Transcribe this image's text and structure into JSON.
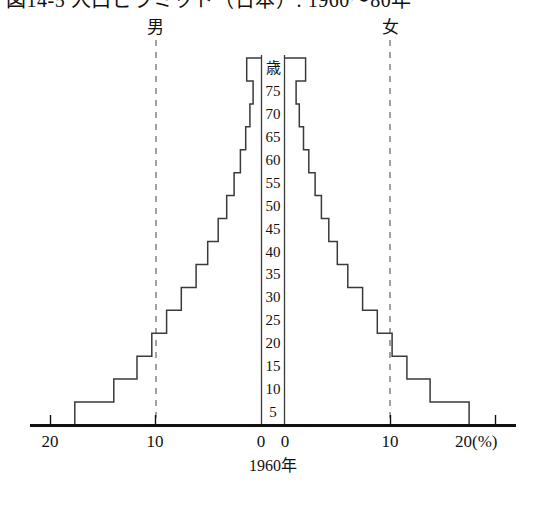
{
  "figure": {
    "title": "図14-5 人口ピラミッド（日本）: 1960〜80年",
    "male_label": "男",
    "female_label": "女",
    "x_caption": "1960年",
    "age_unit_label": "歳"
  },
  "axis": {
    "x_ticks_left": [
      "20",
      "10",
      "0"
    ],
    "x_ticks_right": [
      "0",
      "10",
      "20(%)"
    ],
    "x_tick_left_20": "20",
    "x_tick_left_10": "10",
    "x_tick_left_0": "0",
    "x_tick_right_0": "0",
    "x_tick_right_10": "10",
    "x_tick_right_20": "20(%)",
    "age_ticks": [
      "歳",
      "75",
      "70",
      "65",
      "60",
      "55",
      "50",
      "45",
      "40",
      "35",
      "30",
      "25",
      "20",
      "15",
      "10",
      "5"
    ],
    "dashed_gridline_value": 10
  },
  "colors": {
    "stroke": "#3a3a3a",
    "axis": "#111111",
    "gridline": "#666666",
    "background": "#ffffff"
  },
  "chart_data": {
    "type": "bar",
    "subtype": "population-pyramid",
    "title": "図14-5 人口ピラミッド（日本）: 1960〜80年",
    "xlabel": "1960年",
    "ylabel": "歳",
    "xunit": "%",
    "xlim": [
      0,
      20
    ],
    "grid": true,
    "gridlines": [
      10
    ],
    "legend_position": "top",
    "categories": [
      "0-4",
      "5-9",
      "10-14",
      "15-19",
      "20-24",
      "25-29",
      "30-34",
      "35-39",
      "40-44",
      "45-49",
      "50-54",
      "55-59",
      "60-64",
      "65-69",
      "70-74",
      "75+"
    ],
    "series": [
      {
        "name": "男",
        "side": "left",
        "values": [
          17.7,
          14.0,
          11.8,
          10.4,
          9.0,
          7.6,
          6.2,
          5.1,
          4.1,
          3.3,
          2.6,
          2.0,
          1.5,
          1.1,
          0.8,
          1.4
        ]
      },
      {
        "name": "女",
        "side": "right",
        "values": [
          17.5,
          13.8,
          11.6,
          10.2,
          8.8,
          7.4,
          6.0,
          5.0,
          4.2,
          3.5,
          2.9,
          2.3,
          1.8,
          1.4,
          1.1,
          2.0
        ]
      }
    ]
  }
}
